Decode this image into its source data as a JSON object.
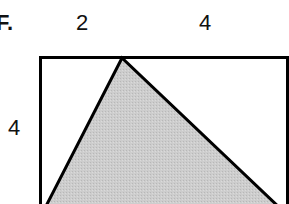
{
  "figure": {
    "label": "F.",
    "dimensions": {
      "top_left_segment": "2",
      "top_right_segment": "4",
      "left_side": "4"
    },
    "colors": {
      "stroke": "#000000",
      "triangle_fill": "#c8c8c8",
      "background": "#ffffff"
    },
    "shapes": {
      "rectangle": {
        "x": 40,
        "y": 57,
        "width": 248,
        "height": 160
      },
      "triangle": {
        "apex": [
          122,
          58
        ],
        "bottom_left": [
          44,
          210
        ],
        "bottom_right": [
          282,
          210
        ]
      }
    }
  }
}
